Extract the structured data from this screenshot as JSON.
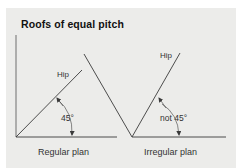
{
  "title": "Roofs of equal pitch",
  "diagrams": [
    {
      "id": "regular",
      "caption": "Regular plan",
      "hip_label": "Hip",
      "angle_label": "45°"
    },
    {
      "id": "irregular",
      "caption": "Irregular plan",
      "hip_label": "Hip",
      "angle_label": "not 45°"
    }
  ],
  "colors": {
    "panel_background": "#ececea",
    "line": "#3a3a3a",
    "text": "#333333",
    "title": "#111111"
  }
}
